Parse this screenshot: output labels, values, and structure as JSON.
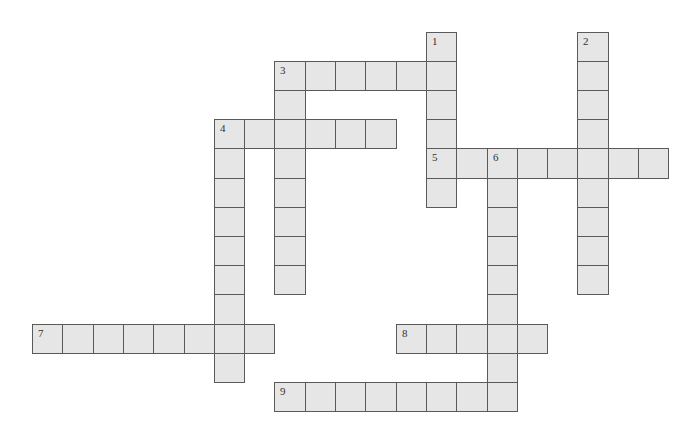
{
  "puzzle": {
    "type": "crossword",
    "grid": {
      "origin_x": 32,
      "origin_y": 31.6,
      "cell_w": 30.3,
      "cell_h": 29.2,
      "cols": 21,
      "rows": 13
    },
    "colors": {
      "background": "#ffffff",
      "cell_fill": "#e6e6e6",
      "cell_border": "#5a5a5a",
      "number_text": "#333333"
    },
    "entries": [
      {
        "number": "1",
        "direction": "down",
        "row": 0,
        "col": 13,
        "length": 6
      },
      {
        "number": "2",
        "direction": "down",
        "row": 0,
        "col": 18,
        "length": 9
      },
      {
        "number": "3",
        "direction": "across",
        "row": 1,
        "col": 8,
        "length": 6
      },
      {
        "number": "3",
        "direction": "down",
        "row": 1,
        "col": 8,
        "length": 8
      },
      {
        "number": "4",
        "direction": "across",
        "row": 3,
        "col": 6,
        "length": 6
      },
      {
        "number": "4",
        "direction": "down",
        "row": 3,
        "col": 6,
        "length": 9
      },
      {
        "number": "5",
        "direction": "across",
        "row": 4,
        "col": 13,
        "length": 8
      },
      {
        "number": "6",
        "direction": "down",
        "row": 4,
        "col": 15,
        "length": 9
      },
      {
        "number": "7",
        "direction": "across",
        "row": 10,
        "col": 0,
        "length": 8
      },
      {
        "number": "8",
        "direction": "across",
        "row": 10,
        "col": 12,
        "length": 5
      },
      {
        "number": "9",
        "direction": "across",
        "row": 12,
        "col": 8,
        "length": 8
      }
    ]
  }
}
